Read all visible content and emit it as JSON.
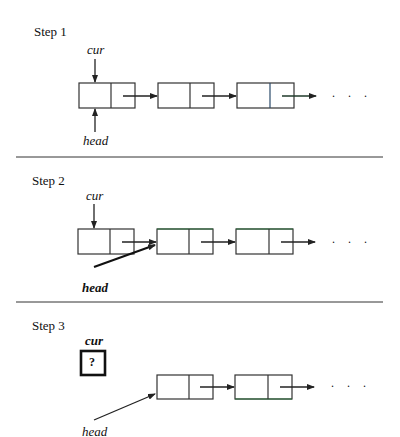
{
  "steps": [
    {
      "title": "Step 1",
      "cur_label": "cur",
      "head_label": "head",
      "ellipsis": ". . ."
    },
    {
      "title": "Step 2",
      "cur_label": "cur",
      "head_label": "head",
      "ellipsis": ". . ."
    },
    {
      "title": "Step 3",
      "cur_label": "cur",
      "head_label": "head",
      "unknown_value": "?",
      "ellipsis": ". . ."
    }
  ],
  "colors": {
    "line": "#222222",
    "node_edge_accent": "#2b6e3a"
  }
}
